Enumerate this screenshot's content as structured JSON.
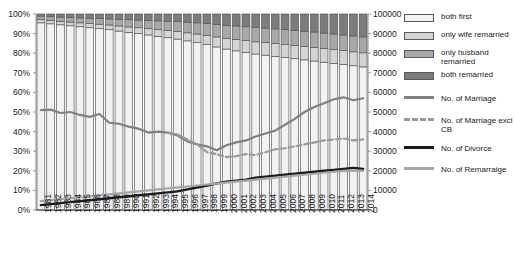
{
  "chart_data": {
    "type": "bar",
    "title": "",
    "subtitle": "",
    "xlabel": "",
    "ylabel": "",
    "ylabel_right": "",
    "grid": false,
    "legend_position": "right",
    "categories": [
      "1981",
      "1982",
      "1983",
      "1984",
      "1985",
      "1986",
      "1987",
      "1988",
      "1989",
      "1990",
      "1991",
      "1992",
      "1993",
      "1994",
      "1995",
      "1996",
      "1997",
      "1998",
      "1999",
      "2000",
      "2001",
      "2002",
      "2003",
      "2004",
      "2005",
      "2006",
      "2007",
      "2008",
      "2009",
      "2010",
      "2011",
      "2012",
      "2013",
      "2014"
    ],
    "left_axis": {
      "ylim": [
        0,
        100
      ],
      "ticks": [
        0,
        10,
        20,
        30,
        40,
        50,
        60,
        70,
        80,
        90,
        100
      ],
      "tick_labels": [
        "0%",
        "10%",
        "20%",
        "30%",
        "40%",
        "50%",
        "60%",
        "70%",
        "80%",
        "90%",
        "100%"
      ],
      "unit": "percent"
    },
    "right_axis": {
      "ylim": [
        0,
        100000
      ],
      "ticks": [
        0,
        10000,
        20000,
        30000,
        40000,
        50000,
        60000,
        70000,
        80000,
        90000,
        100000
      ],
      "tick_labels": [
        "0",
        "10000",
        "20000",
        "30000",
        "40000",
        "50000",
        "60000",
        "70000",
        "80000",
        "90000",
        "100000"
      ],
      "unit": "count"
    },
    "stacked_series": [
      {
        "name": "both first",
        "color": "#f2f2f2",
        "values": [
          95.5,
          95.0,
          94.5,
          94.0,
          93.5,
          93.0,
          92.5,
          92.0,
          91.3,
          90.6,
          90.0,
          89.3,
          88.6,
          87.9,
          87.2,
          86.3,
          85.4,
          84.4,
          83.2,
          82.1,
          81.2,
          80.4,
          79.6,
          79.0,
          78.4,
          77.8,
          77.2,
          76.6,
          76.0,
          75.4,
          74.8,
          74.2,
          73.6,
          73.0
        ]
      },
      {
        "name": "only wife remarried",
        "color": "#d4d4d4",
        "values": [
          1.6,
          1.7,
          1.8,
          1.9,
          2.0,
          2.1,
          2.3,
          2.4,
          2.6,
          2.8,
          3.0,
          3.2,
          3.4,
          3.6,
          3.8,
          4.1,
          4.4,
          4.7,
          5.1,
          5.5,
          5.8,
          6.0,
          6.2,
          6.4,
          6.5,
          6.6,
          6.7,
          6.8,
          6.9,
          7.0,
          7.0,
          7.1,
          7.1,
          7.2
        ]
      },
      {
        "name": "only husband remarried",
        "color": "#a8a8a8",
        "values": [
          1.8,
          1.9,
          2.1,
          2.3,
          2.5,
          2.7,
          2.9,
          3.1,
          3.4,
          3.7,
          3.9,
          4.2,
          4.5,
          4.8,
          5.1,
          5.4,
          5.7,
          6.0,
          6.3,
          6.6,
          6.9,
          7.1,
          7.3,
          7.4,
          7.5,
          7.6,
          7.7,
          7.8,
          7.9,
          7.9,
          8.0,
          8.0,
          8.1,
          8.1
        ]
      },
      {
        "name": "both remarried",
        "color": "#7c7c7c",
        "values": [
          1.1,
          1.4,
          1.6,
          1.8,
          2.0,
          2.2,
          2.3,
          2.5,
          2.7,
          2.9,
          3.1,
          3.3,
          3.5,
          3.7,
          3.9,
          4.2,
          4.5,
          4.9,
          5.4,
          5.8,
          6.1,
          6.5,
          6.9,
          7.2,
          7.6,
          8.0,
          8.4,
          8.8,
          9.2,
          9.7,
          10.2,
          10.7,
          11.2,
          11.7
        ]
      }
    ],
    "line_series": [
      {
        "name": "No. of Marriage",
        "color": "#808080",
        "style": "solid",
        "axis": "right",
        "values": [
          51000,
          51200,
          49500,
          53000,
          50000,
          48500,
          47500,
          49000,
          46500,
          44500,
          44000,
          42500,
          41500,
          40000,
          39500,
          40000,
          39500,
          38000,
          36500,
          35000,
          33500,
          32500,
          30500,
          31500,
          33000,
          34500,
          35500,
          37500,
          39500,
          39000,
          40500,
          43500,
          46500,
          47500,
          50000,
          52500,
          54500,
          56500,
          55000,
          57500,
          56000,
          57000
        ]
      },
      {
        "name": "No. of Marriage excl CB",
        "color": "#9a9a9a",
        "style": "dashed",
        "axis": "right",
        "values": [
          null,
          null,
          null,
          null,
          null,
          null,
          null,
          null,
          null,
          null,
          null,
          null,
          null,
          null,
          null,
          39500,
          38500,
          36000,
          33500,
          31000,
          29500,
          28500,
          27000,
          27500,
          28500,
          28000,
          29500,
          30500,
          31000,
          31500,
          32500,
          33500,
          34500,
          35500,
          36500,
          36000,
          36500,
          35500,
          36000
        ]
      },
      {
        "name": "No. of Divorce",
        "color": "#1a1a1a",
        "style": "solid",
        "axis": "right",
        "values": [
          2500,
          3000,
          3500,
          4000,
          4500,
          5000,
          5500,
          6000,
          6500,
          7000,
          7500,
          8000,
          8500,
          9000,
          9500,
          10500,
          11500,
          12500,
          13500,
          14500,
          15000,
          15500,
          16500,
          17000,
          17500,
          18000,
          18500,
          19000,
          19500,
          20000,
          20500,
          21000,
          21500,
          21000
        ]
      },
      {
        "name": "No. of Remarraige",
        "color": "#a6a6a6",
        "style": "solid",
        "axis": "right",
        "values": [
          4500,
          5000,
          5500,
          6000,
          6500,
          7000,
          7500,
          8000,
          8500,
          9000,
          9500,
          10000,
          10500,
          11000,
          11500,
          12000,
          12500,
          13000,
          13500,
          14000,
          14500,
          15000,
          15500,
          16000,
          16500,
          17000,
          17500,
          18000,
          18500,
          19000,
          19500,
          20000,
          20000,
          20000
        ]
      }
    ]
  },
  "legend": {
    "items": [
      {
        "label": "both first",
        "type": "box",
        "color": "#f2f2f2"
      },
      {
        "label": "only wife remarried",
        "type": "box",
        "color": "#d4d4d4"
      },
      {
        "label": "only husband remarried",
        "type": "box",
        "color": "#a8a8a8"
      },
      {
        "label": "both remarried",
        "type": "box",
        "color": "#7c7c7c"
      },
      {
        "label": "No. of Marriage",
        "type": "line",
        "color": "#808080"
      },
      {
        "label": "No. of Marriage excl CB",
        "type": "dashed",
        "color": "#9a9a9a"
      },
      {
        "label": "No. of Divorce",
        "type": "line",
        "color": "#1a1a1a"
      },
      {
        "label": "No. of Remarraige",
        "type": "line",
        "color": "#a6a6a6"
      }
    ]
  },
  "plot": {
    "left": 36,
    "top": 14,
    "width": 332,
    "height": 196
  }
}
